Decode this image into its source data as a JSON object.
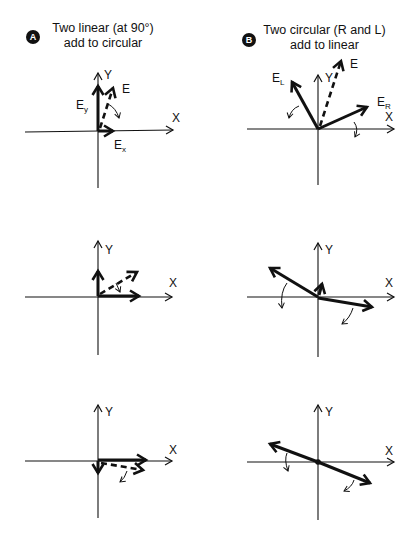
{
  "columns": [
    {
      "badge": "A",
      "title_line1": "Two linear (at 90°)",
      "title_line2": "add to circular"
    },
    {
      "badge": "B",
      "title_line1": "Two circular (R and L)",
      "title_line2": "add to linear"
    }
  ],
  "axis_labels": {
    "x": "X",
    "y": "Y"
  },
  "vector_labels": {
    "E": "E",
    "Ey_main": "E",
    "Ey_sub": "y",
    "Ex_main": "E",
    "Ex_sub": "x",
    "EL_main": "E",
    "EL_sub": "L",
    "ER_main": "E",
    "ER_sub": "R"
  },
  "panels": [
    {
      "id": "A1",
      "description": "Ey max, Ex small; resultant E near vertical, rotating clockwise"
    },
    {
      "id": "A2",
      "description": "Ey and Ex comparable; resultant E at ~35°"
    },
    {
      "id": "A3",
      "description": "Ey small negative, Ex max; resultant E just below X axis"
    },
    {
      "id": "B1",
      "description": "EL at ~120°, ER at ~25°; resultant E (dashed) at ~70°"
    },
    {
      "id": "B2",
      "description": "EL at ~150°, ER at ~-10°; small resultant upward"
    },
    {
      "id": "B3",
      "description": "EL at ~155°, ER at ~-25°; resultant zero (dot at origin)"
    }
  ],
  "colors": {
    "ink": "#111111",
    "background": "#ffffff"
  }
}
